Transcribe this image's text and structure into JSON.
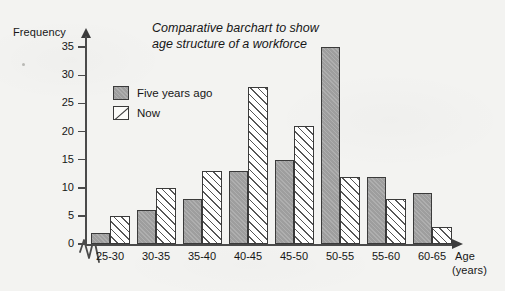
{
  "chart_data": {
    "type": "bar",
    "title": "Comparative barchart to show age structure of a workforce",
    "title_line1": "Comparative barchart to show",
    "title_line2": "age structure of a workforce",
    "xlabel": "Age",
    "xlabel_sub": "(years)",
    "ylabel": "Frequency",
    "categories": [
      "25-30",
      "30-35",
      "35-40",
      "40-45",
      "45-50",
      "50-55",
      "55-60",
      "60-65"
    ],
    "series": [
      {
        "name": "Five years ago",
        "style": "solid-grey",
        "color": "#9e9e9e",
        "values": [
          2,
          6,
          8,
          13,
          15,
          35,
          12,
          9
        ]
      },
      {
        "name": "Now",
        "style": "diagonal-hatch",
        "color": "#ffffff",
        "values": [
          5,
          10,
          13,
          28,
          21,
          12,
          8,
          3
        ]
      }
    ],
    "ylim": [
      0,
      37
    ],
    "yticks": [
      0,
      5,
      10,
      15,
      20,
      25,
      30,
      35
    ],
    "ytick_labels": [
      "0",
      "5",
      "10",
      "15",
      "20",
      "25",
      "30",
      "35"
    ],
    "grid": false,
    "legend_position": "upper-left-inside",
    "axis_break": "zigzag-at-origin",
    "axis_arrows": true
  }
}
